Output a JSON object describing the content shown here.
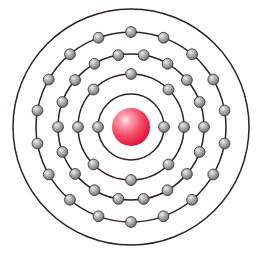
{
  "figure": {
    "background_color": "#ffffff",
    "width": 262,
    "height": 254,
    "center_x": 131,
    "center_y": 127
  },
  "nucleus": {
    "name": "nucleus",
    "radius": 19,
    "color_core": "#f0304a",
    "color_highlight": "#ffd6dd",
    "color_edge": "#e01030",
    "highlight_offset_x": -0.3,
    "highlight_offset_y": -0.32
  },
  "electron_style": {
    "radius": 5.4,
    "color_core": "#8d8d8d",
    "color_highlight": "#e8e8e8",
    "color_edge": "#4a4a4a",
    "stroke": "#3a3a3a"
  },
  "ring_style": {
    "stroke_color": "#2e2228",
    "stroke_width": 1.5
  },
  "chart_data": {
    "type": "diagram",
    "subtype": "bohr-atom-model",
    "total_electrons": 46,
    "shell_count": 5,
    "shells": [
      {
        "index": 1,
        "label": "K",
        "radius": 33,
        "electron_count": 2,
        "start_angle": 0
      },
      {
        "index": 2,
        "label": "L",
        "radius": 53,
        "electron_count": 8,
        "start_angle": 0
      },
      {
        "index": 3,
        "label": "M",
        "radius": 73,
        "electron_count": 18,
        "start_angle": 0
      },
      {
        "index": 4,
        "label": "N",
        "radius": 95,
        "electron_count": 18,
        "start_angle": 10
      },
      {
        "index": 5,
        "label": "O",
        "radius": 118,
        "electron_count": 0,
        "start_angle": 0
      }
    ],
    "electron_configuration": "2, 8, 18, 18, 0",
    "legend": [],
    "annotations": []
  }
}
